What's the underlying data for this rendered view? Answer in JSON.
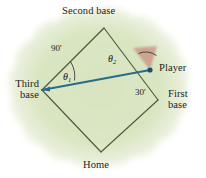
{
  "figure": {
    "title_alt": "Baseball diamond with player between second and first base",
    "colors": {
      "field_green": "#d7e3bd",
      "field_green_light": "#e6eed4",
      "diamond_outline": "#4e5a3e",
      "player_line": "#2b6a88",
      "angle_wedge": "#c98b7e",
      "background": "#ffffff",
      "text": "#1c1c1c"
    },
    "labels": {
      "second_base": "Second base",
      "third_base_line1": "Third",
      "third_base_line2": "base",
      "first_base_line1": "First",
      "first_base_line2": "base",
      "home": "Home",
      "player": "Player"
    },
    "dimensions": {
      "third_to_second": "90'",
      "player_to_first": "30'"
    },
    "angles": {
      "theta1_symbol": "θ",
      "theta1_subscript": "1",
      "theta2_symbol": "θ",
      "theta2_subscript": "2"
    },
    "geometry": {
      "second_base_point": "104,28",
      "third_base_point": "42,90",
      "first_base_point": "158,100",
      "home_point": "101,152",
      "player_point": "150,70"
    }
  }
}
